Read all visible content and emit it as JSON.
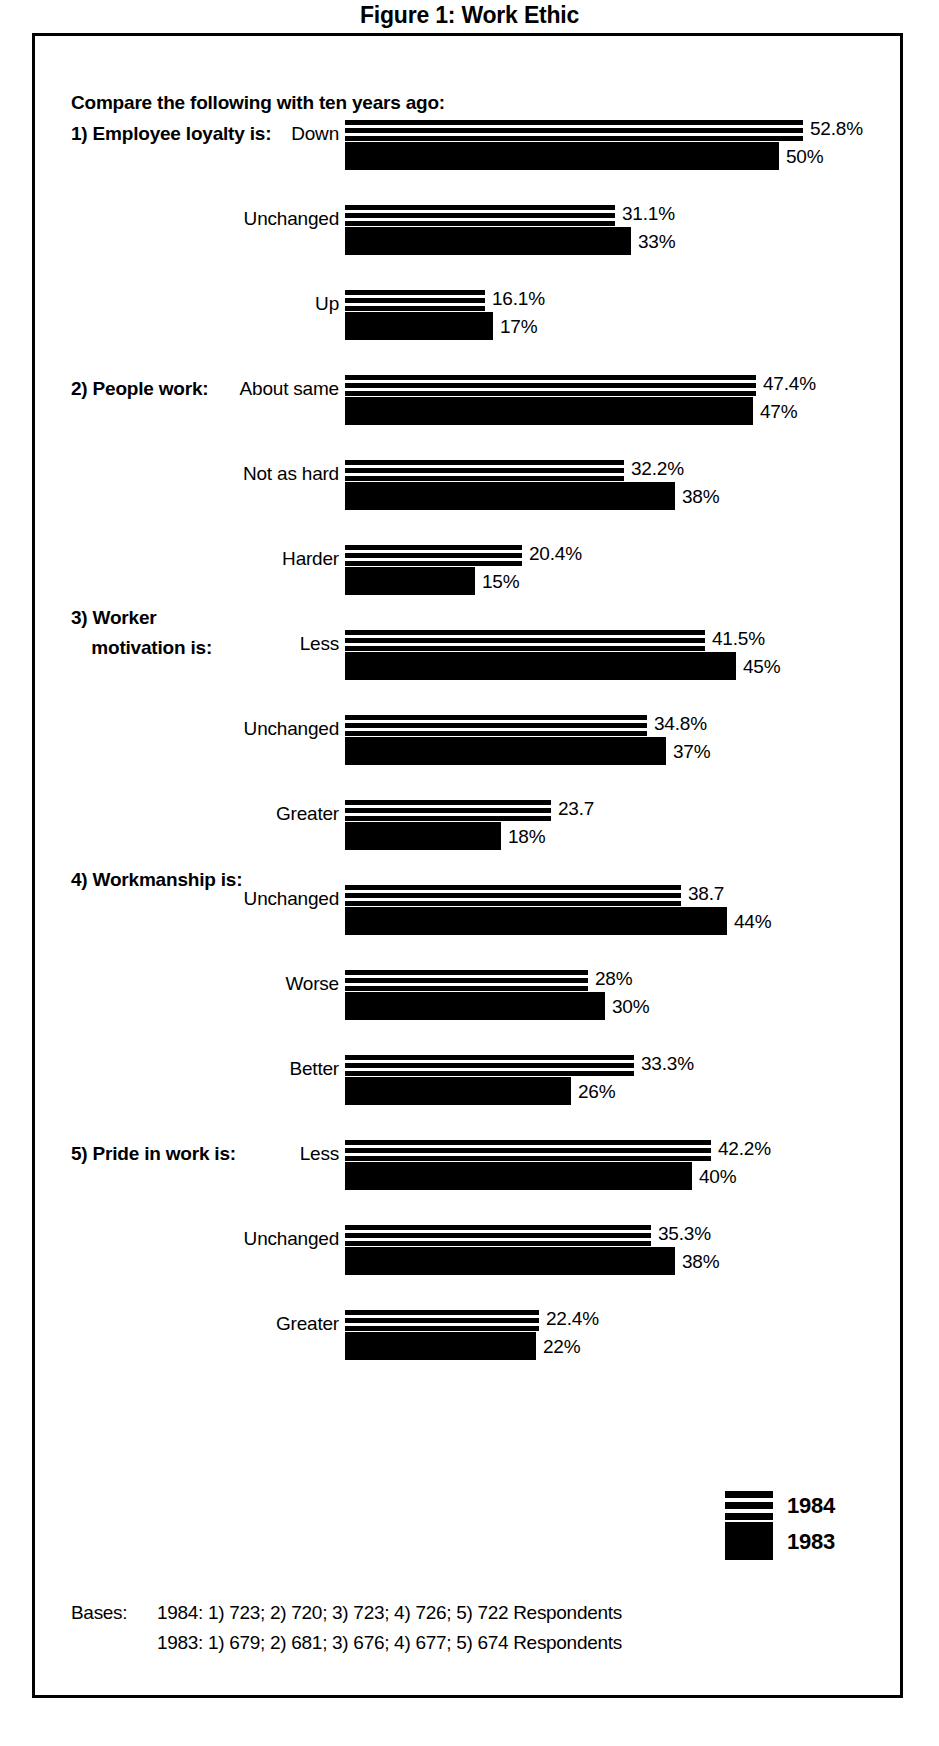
{
  "title": "Figure 1: Work Ethic",
  "prompt": "Compare the following with ten years ago:",
  "legend": {
    "series_1_label": "1984",
    "series_2_label": "1983",
    "series_1_style": "striped",
    "series_2_style": "solid"
  },
  "bases": {
    "label": "Bases:",
    "row_1984": "1984: 1) 723; 2) 720; 3) 723; 4) 726; 5) 722 Respondents",
    "row_1983": "1983: 1) 679; 2) 681; 3) 676; 4) 677; 5) 674 Respondents"
  },
  "colors": {
    "ink": "#000000",
    "paper": "#ffffff"
  },
  "chart_data": {
    "type": "bar",
    "orientation": "horizontal",
    "title": "Figure 1: Work Ethic",
    "subtitle": "Compare the following with ten years ago:",
    "xlabel": "",
    "ylabel": "",
    "xlim": [
      0,
      60
    ],
    "grid": false,
    "legend_position": "bottom-right",
    "series_names": [
      "1984",
      "1983"
    ],
    "groups": [
      {
        "number": "1)",
        "question": "Employee loyalty is:",
        "question_lines": [
          "1) Employee loyalty is:"
        ],
        "categories": [
          "Down",
          "Unchanged",
          "Up"
        ],
        "series": [
          {
            "name": "1984",
            "values": [
              52.8,
              31.1,
              16.1
            ],
            "labels": [
              "52.8%",
              "31.1%",
              "16.1%"
            ]
          },
          {
            "name": "1983",
            "values": [
              50,
              33,
              17
            ],
            "labels": [
              "50%",
              "33%",
              "17%"
            ]
          }
        ]
      },
      {
        "number": "2)",
        "question": "People work:",
        "question_lines": [
          "2) People work:"
        ],
        "categories": [
          "About same",
          "Not as hard",
          "Harder"
        ],
        "series": [
          {
            "name": "1984",
            "values": [
              47.4,
              32.2,
              20.4
            ],
            "labels": [
              "47.4%",
              "32.2%",
              "20.4%"
            ]
          },
          {
            "name": "1983",
            "values": [
              47,
              38,
              15
            ],
            "labels": [
              "47%",
              "38%",
              "15%"
            ]
          }
        ]
      },
      {
        "number": "3)",
        "question": "Worker motivation is:",
        "question_lines": [
          "3) Worker",
          "    motivation is:"
        ],
        "categories": [
          "Less",
          "Unchanged",
          "Greater"
        ],
        "series": [
          {
            "name": "1984",
            "values": [
              41.5,
              34.8,
              23.7
            ],
            "labels": [
              "41.5%",
              "34.8%",
              "23.7"
            ]
          },
          {
            "name": "1983",
            "values": [
              45,
              37,
              18
            ],
            "labels": [
              "45%",
              "37%",
              "18%"
            ]
          }
        ]
      },
      {
        "number": "4)",
        "question": "Workmanship is:",
        "question_lines": [
          "4) Workmanship is:"
        ],
        "categories": [
          "Unchanged",
          "Worse",
          "Better"
        ],
        "series": [
          {
            "name": "1984",
            "values": [
              38.7,
              28,
              33.3
            ],
            "labels": [
              "38.7",
              "28%",
              "33.3%"
            ]
          },
          {
            "name": "1983",
            "values": [
              44,
              30,
              26
            ],
            "labels": [
              "44%",
              "30%",
              "26%"
            ]
          }
        ]
      },
      {
        "number": "5)",
        "question": "Pride in work is:",
        "question_lines": [
          "5) Pride in work is:"
        ],
        "categories": [
          "Less",
          "Unchanged",
          "Greater"
        ],
        "series": [
          {
            "name": "1984",
            "values": [
              42.2,
              35.3,
              22.4
            ],
            "labels": [
              "42.2%",
              "35.3%",
              "22.4%"
            ]
          },
          {
            "name": "1983",
            "values": [
              40,
              38,
              22
            ],
            "labels": [
              "40%",
              "38%",
              "22%"
            ]
          }
        ]
      }
    ]
  }
}
